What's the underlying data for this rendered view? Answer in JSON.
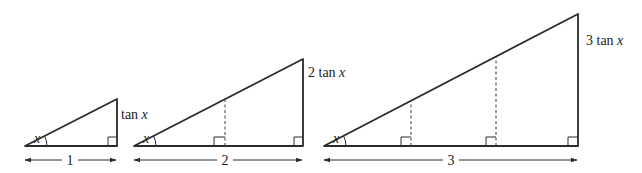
{
  "diagram": {
    "title": "",
    "angle_label": "x",
    "triangles": [
      {
        "id": "t1",
        "base_label": "1",
        "height_label_coef": "",
        "height_label_fn": "tan",
        "height_label_var": "x",
        "subdivisions": 1
      },
      {
        "id": "t2",
        "base_label": "2",
        "height_label_coef": "2",
        "height_label_fn": "tan",
        "height_label_var": "x",
        "subdivisions": 2
      },
      {
        "id": "t3",
        "base_label": "3",
        "height_label_coef": "3",
        "height_label_fn": "tan",
        "height_label_var": "x",
        "subdivisions": 3
      }
    ],
    "colors": {
      "stroke": "#2b2b2b",
      "background": "#ffffff"
    }
  }
}
